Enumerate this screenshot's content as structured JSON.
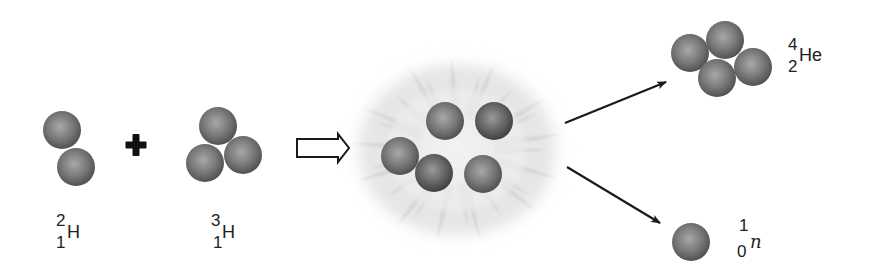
{
  "diagram": {
    "type": "nuclear-fusion-reaction",
    "colors": {
      "background": "#ffffff",
      "nucleon_highlight": "#a8a8a8",
      "nucleon_mid": "#7a7a7a",
      "nucleon_edge": "#4e4e4e",
      "nucleon_dark_edge": "#3e3e3e",
      "arrow": "#1a1a1a",
      "plus": "#111111",
      "cloud": "#cfcfcf"
    },
    "reactants": [
      {
        "name": "deuterium",
        "symbol": "H",
        "mass_number": "2",
        "atomic_number": "1",
        "nucleons": [
          {
            "cx": 62,
            "cy": 130,
            "r": 19
          },
          {
            "cx": 76,
            "cy": 167,
            "r": 19
          }
        ],
        "label_pos": {
          "x": 52,
          "y": 212
        }
      },
      {
        "name": "tritium",
        "symbol": "H",
        "mass_number": "3",
        "atomic_number": "1",
        "nucleons": [
          {
            "cx": 218,
            "cy": 126,
            "r": 19
          },
          {
            "cx": 243,
            "cy": 155,
            "r": 19
          },
          {
            "cx": 205,
            "cy": 163,
            "r": 19
          }
        ],
        "label_pos": {
          "x": 207,
          "y": 212
        }
      }
    ],
    "operator": {
      "symbol": "+",
      "cx": 136,
      "cy": 145
    },
    "reaction_arrow": {
      "style": "hollow",
      "x1": 297,
      "x2": 349,
      "cy": 148
    },
    "intermediate": {
      "name": "fusion-burst",
      "cloud": {
        "cx": 457,
        "cy": 150,
        "rx": 115,
        "ry": 100
      },
      "nucleons": [
        {
          "cx": 445,
          "cy": 121,
          "r": 19
        },
        {
          "cx": 494,
          "cy": 121,
          "r": 19,
          "dark": true
        },
        {
          "cx": 400,
          "cy": 156,
          "r": 19
        },
        {
          "cx": 434,
          "cy": 173,
          "r": 19,
          "dark": true
        },
        {
          "cx": 483,
          "cy": 174,
          "r": 19
        }
      ]
    },
    "product_arrows": [
      {
        "x1": 565,
        "y1": 123,
        "x2": 666,
        "y2": 82
      },
      {
        "x1": 567,
        "y1": 167,
        "x2": 660,
        "y2": 223
      }
    ],
    "products": [
      {
        "name": "helium-4",
        "symbol": "He",
        "mass_number": "4",
        "atomic_number": "2",
        "italic": false,
        "nucleons": [
          {
            "cx": 690,
            "cy": 53,
            "r": 19
          },
          {
            "cx": 725,
            "cy": 40,
            "r": 19
          },
          {
            "cx": 753,
            "cy": 67,
            "r": 19
          },
          {
            "cx": 717,
            "cy": 78,
            "r": 19
          }
        ],
        "label_pos": {
          "x": 786,
          "y": 36
        }
      },
      {
        "name": "neutron",
        "symbol": "n",
        "mass_number": "1",
        "atomic_number": "0",
        "italic": true,
        "nucleons": [
          {
            "cx": 691,
            "cy": 242,
            "r": 19
          }
        ],
        "label_pos": {
          "x": 736,
          "y": 217
        }
      }
    ]
  }
}
